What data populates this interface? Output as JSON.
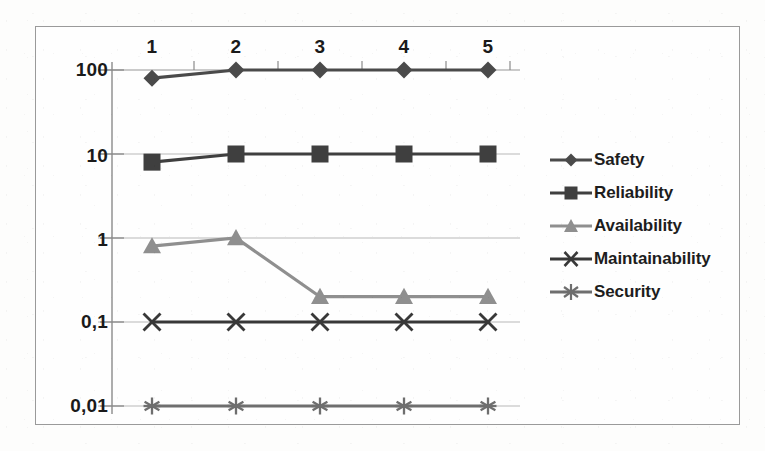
{
  "chart_data": {
    "type": "line",
    "title": "",
    "subtitle": "",
    "xlabel": "",
    "ylabel": "",
    "x_axis_position": "top",
    "yscale": "log",
    "ylim": [
      0.01,
      100
    ],
    "grid": true,
    "legend_position": "right",
    "categories": [
      "1",
      "2",
      "3",
      "4",
      "5"
    ],
    "ytick_labels": [
      "100",
      "10",
      "1",
      "0,1",
      "0,01"
    ],
    "ytick_values": [
      100,
      10,
      1,
      0.1,
      0.01
    ],
    "series": [
      {
        "name": "Safety",
        "marker": "diamond",
        "color": "#4a4a4a",
        "values": [
          80,
          100,
          100,
          100,
          100
        ]
      },
      {
        "name": "Reliability",
        "marker": "square",
        "color": "#3f3f3f",
        "values": [
          8,
          10,
          10,
          10,
          10
        ]
      },
      {
        "name": "Availability",
        "marker": "triangle",
        "color": "#8f8f8f",
        "values": [
          0.8,
          1,
          0.2,
          0.2,
          0.2
        ]
      },
      {
        "name": "Maintainability",
        "marker": "x",
        "color": "#383838",
        "values": [
          0.1,
          0.1,
          0.1,
          0.1,
          0.1
        ]
      },
      {
        "name": "Security",
        "marker": "asterisk",
        "color": "#6e6e6e",
        "values": [
          0.01,
          0.01,
          0.01,
          0.01,
          0.01
        ]
      }
    ]
  },
  "legend": {
    "items": [
      {
        "label": "Safety",
        "marker": "diamond-marker-icon"
      },
      {
        "label": "Reliability",
        "marker": "square-marker-icon"
      },
      {
        "label": "Availability",
        "marker": "triangle-marker-icon"
      },
      {
        "label": "Maintainability",
        "marker": "x-marker-icon"
      },
      {
        "label": "Security",
        "marker": "asterisk-marker-icon"
      }
    ]
  },
  "axes": {
    "x_tick_labels": [
      "1",
      "2",
      "3",
      "4",
      "5"
    ],
    "y_tick_labels": [
      "100",
      "10",
      "1",
      "0,1",
      "0,01"
    ]
  },
  "colors": {
    "grid": "#b8b8b8",
    "axis": "#8a8a8a",
    "frame": "#9a9a9a",
    "text": "#1a1a1a",
    "background": "#fefefe"
  }
}
